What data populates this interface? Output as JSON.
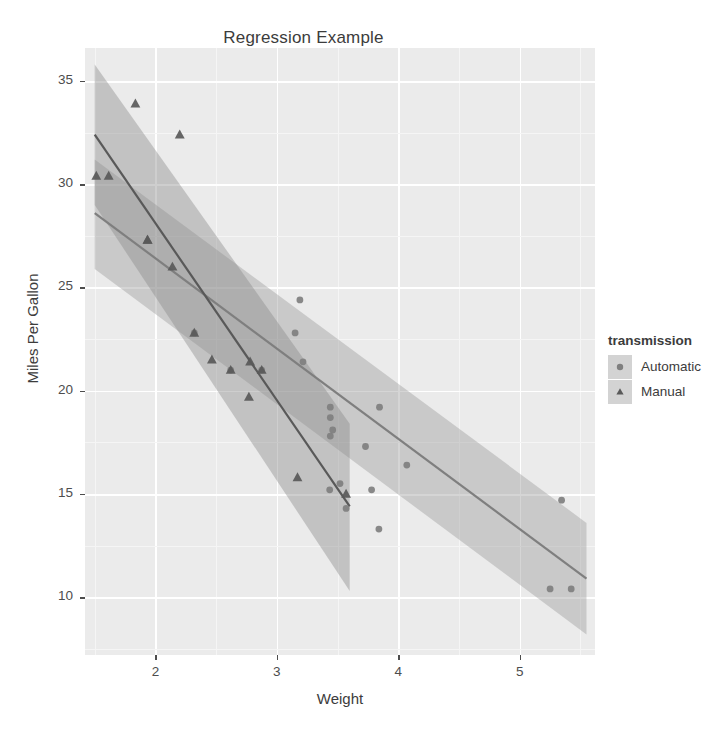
{
  "chart_data": {
    "type": "scatter",
    "title": "Regression Example",
    "xlabel": "Weight",
    "ylabel": "Miles Per Gallon",
    "xlim": [
      1.42,
      5.62
    ],
    "ylim": [
      7.2,
      36.6
    ],
    "xticks": [
      2,
      3,
      4,
      5
    ],
    "yticks": [
      10,
      15,
      20,
      25,
      30,
      35
    ],
    "grid": true,
    "legend": {
      "position": "right",
      "title": "transmission",
      "entries": [
        {
          "label": "Automatic",
          "marker": "circle",
          "color": "#7f7f7f"
        },
        {
          "label": "Manual",
          "marker": "triangle",
          "color": "#595959"
        }
      ]
    },
    "series": [
      {
        "name": "Automatic",
        "marker": "circle",
        "color": "#7f7f7f",
        "band_color": "#9a9a9a",
        "points": [
          {
            "x": 2.62,
            "y": 21.0
          },
          {
            "x": 2.875,
            "y": 21.0
          },
          {
            "x": 2.32,
            "y": 22.8
          },
          {
            "x": 3.215,
            "y": 21.4
          },
          {
            "x": 3.44,
            "y": 18.7
          },
          {
            "x": 3.46,
            "y": 18.1
          },
          {
            "x": 3.57,
            "y": 14.3
          },
          {
            "x": 3.19,
            "y": 24.4
          },
          {
            "x": 3.15,
            "y": 22.8
          },
          {
            "x": 3.44,
            "y": 19.2
          },
          {
            "x": 3.44,
            "y": 17.8
          },
          {
            "x": 4.07,
            "y": 16.4
          },
          {
            "x": 3.73,
            "y": 17.3
          },
          {
            "x": 3.78,
            "y": 15.2
          },
          {
            "x": 5.25,
            "y": 10.4
          },
          {
            "x": 5.424,
            "y": 10.4
          },
          {
            "x": 5.345,
            "y": 14.7
          },
          {
            "x": 3.52,
            "y": 15.5
          },
          {
            "x": 3.435,
            "y": 15.2
          },
          {
            "x": 3.84,
            "y": 13.3
          },
          {
            "x": 3.845,
            "y": 19.2
          }
        ],
        "fit": {
          "x0": 1.5,
          "y0": 28.6,
          "x1": 5.55,
          "y1": 10.9
        },
        "band": {
          "x0": 1.5,
          "y0_lo": 25.9,
          "y0_hi": 31.2,
          "x1": 5.55,
          "y1_lo": 8.2,
          "y1_hi": 13.6
        }
      },
      {
        "name": "Manual",
        "marker": "triangle",
        "color": "#595959",
        "band_color": "#8a8a8a",
        "points": [
          {
            "x": 1.513,
            "y": 30.4
          },
          {
            "x": 1.615,
            "y": 30.4
          },
          {
            "x": 1.835,
            "y": 33.9
          },
          {
            "x": 1.935,
            "y": 27.3
          },
          {
            "x": 2.14,
            "y": 26.0
          },
          {
            "x": 2.2,
            "y": 32.4
          },
          {
            "x": 2.465,
            "y": 21.5
          },
          {
            "x": 2.62,
            "y": 21.0
          },
          {
            "x": 2.77,
            "y": 19.7
          },
          {
            "x": 2.875,
            "y": 21.0
          },
          {
            "x": 3.17,
            "y": 15.8
          },
          {
            "x": 3.57,
            "y": 15.0
          },
          {
            "x": 2.78,
            "y": 21.4
          },
          {
            "x": 2.32,
            "y": 22.8
          },
          {
            "x": 1.935,
            "y": 27.3
          }
        ],
        "fit": {
          "x0": 1.5,
          "y0": 32.4,
          "x1": 3.6,
          "y1": 14.4
        },
        "band": {
          "x0": 1.5,
          "y0_lo": 29.0,
          "y0_hi": 35.8,
          "x1": 3.6,
          "y1_lo": 10.3,
          "y1_hi": 18.4
        }
      }
    ]
  },
  "colors": {
    "panel_background": "#ebebeb",
    "grid_major": "#ffffff",
    "grid_minor": "#f5f5f5",
    "text": "#3c3c3c",
    "tick_text": "#4d4d4d"
  }
}
